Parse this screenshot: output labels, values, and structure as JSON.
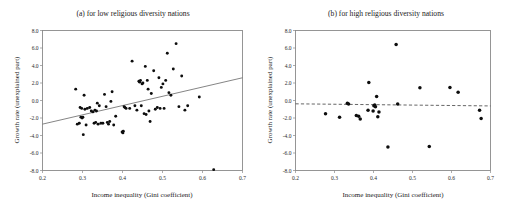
{
  "figure": {
    "background": "#ffffff",
    "point_color": "#0d0d0d",
    "frame_color": "#8a8a8a",
    "fit_line_color": "#6f6f6f"
  },
  "chart_data": [
    {
      "type": "scatter",
      "panel": "a",
      "title": "(a) for low religious diversity nations",
      "xlabel": "Income inequality (Gini coefficient)",
      "ylabel": "Growth rate (unexplained part)",
      "xlim": [
        0.2,
        0.7
      ],
      "ylim": [
        -8.0,
        8.0
      ],
      "xticks": [
        0.2,
        0.3,
        0.4,
        0.5,
        0.6,
        0.7
      ],
      "xtick_labels": [
        "0.2",
        "0.3",
        "0.4",
        "0.5",
        "0.6",
        "0.7"
      ],
      "yticks": [
        -8.0,
        -6.0,
        -4.0,
        -2.0,
        0.0,
        2.0,
        4.0,
        6.0,
        8.0
      ],
      "ytick_labels": [
        "-8.0",
        "-6.0",
        "-4.0",
        "-2.0",
        "0.0",
        "2.0",
        "4.0",
        "6.0",
        "8.0"
      ],
      "grid": false,
      "legend": false,
      "trend_line": {
        "style": "solid",
        "x": [
          0.2,
          0.7
        ],
        "y": [
          -2.7,
          2.6
        ],
        "slope": 10.6,
        "intercept": -4.82
      },
      "x": [
        0.283,
        0.287,
        0.292,
        0.294,
        0.296,
        0.298,
        0.299,
        0.301,
        0.302,
        0.304,
        0.306,
        0.309,
        0.312,
        0.318,
        0.322,
        0.326,
        0.329,
        0.331,
        0.333,
        0.335,
        0.337,
        0.339,
        0.342,
        0.346,
        0.351,
        0.355,
        0.359,
        0.362,
        0.365,
        0.368,
        0.371,
        0.374,
        0.378,
        0.383,
        0.399,
        0.401,
        0.402,
        0.404,
        0.406,
        0.409,
        0.418,
        0.424,
        0.431,
        0.436,
        0.441,
        0.443,
        0.445,
        0.447,
        0.449,
        0.451,
        0.454,
        0.457,
        0.459,
        0.462,
        0.464,
        0.466,
        0.469,
        0.472,
        0.478,
        0.482,
        0.487,
        0.491,
        0.494,
        0.497,
        0.501,
        0.504,
        0.508,
        0.512,
        0.516,
        0.521,
        0.527,
        0.534,
        0.541,
        0.548,
        0.556,
        0.563,
        0.592,
        0.628
      ],
      "y": [
        1.3,
        -2.7,
        -2.6,
        -0.8,
        -1.9,
        -0.9,
        -2.0,
        -1.9,
        -3.9,
        0.6,
        -1.0,
        -2.8,
        -0.9,
        -0.8,
        -1.2,
        -1.3,
        -2.6,
        -1.1,
        -2.5,
        -1.2,
        -0.3,
        -2.7,
        -0.6,
        -2.6,
        -2.6,
        0.7,
        -0.7,
        -2.5,
        -2.7,
        -2.4,
        -0.1,
        1.0,
        -2.8,
        -1.8,
        -3.6,
        -3.7,
        -3.5,
        -0.7,
        -0.8,
        -0.9,
        -0.9,
        4.5,
        -0.6,
        -1.1,
        2.2,
        2.1,
        2.3,
        -0.6,
        1.9,
        2.0,
        -1.5,
        3.9,
        -1.6,
        2.3,
        1.3,
        -1.2,
        -2.4,
        0.8,
        3.4,
        -1.0,
        -0.8,
        2.6,
        -0.9,
        1.5,
        1.9,
        -0.9,
        2.3,
        5.4,
        0.9,
        0.6,
        3.6,
        6.5,
        -0.7,
        2.8,
        -1.1,
        -0.6,
        0.4,
        -7.9
      ],
      "n_points": 78
    },
    {
      "type": "scatter",
      "panel": "b",
      "title": "(b) for high religious diversity nations",
      "xlabel": "Income inequality (Gini coefficient)",
      "ylabel": "Growth rate (unexplained part)",
      "xlim": [
        0.2,
        0.7
      ],
      "ylim": [
        -8.0,
        8.0
      ],
      "xticks": [
        0.2,
        0.3,
        0.4,
        0.5,
        0.6,
        0.7
      ],
      "xtick_labels": [
        "0.2",
        "0.3",
        "0.4",
        "0.5",
        "0.6",
        "0.7"
      ],
      "yticks": [
        -8.0,
        -6.0,
        -4.0,
        -2.0,
        0.0,
        2.0,
        4.0,
        6.0,
        8.0
      ],
      "ytick_labels": [
        "-8.0",
        "-6.0",
        "-4.0",
        "-2.0",
        "0.0",
        "2.0",
        "4.0",
        "6.0",
        "8.0"
      ],
      "grid": false,
      "legend": false,
      "trend_line": {
        "style": "dashed",
        "x": [
          0.2,
          0.7
        ],
        "y": [
          -0.38,
          -0.62
        ],
        "slope": -0.48,
        "intercept": -0.284
      },
      "x": [
        0.277,
        0.313,
        0.333,
        0.336,
        0.356,
        0.362,
        0.366,
        0.386,
        0.388,
        0.399,
        0.401,
        0.403,
        0.405,
        0.408,
        0.411,
        0.414,
        0.437,
        0.458,
        0.462,
        0.519,
        0.543,
        0.596,
        0.617,
        0.672,
        0.676
      ],
      "y": [
        -1.5,
        -1.9,
        -0.3,
        -0.4,
        -1.7,
        -1.8,
        -2.1,
        -1.1,
        2.05,
        -1.2,
        -0.6,
        -0.5,
        -0.7,
        0.45,
        -1.85,
        -1.3,
        -5.3,
        6.4,
        -0.4,
        1.45,
        -5.25,
        1.5,
        0.95,
        -1.1,
        -2.05
      ],
      "n_points": 25
    }
  ]
}
